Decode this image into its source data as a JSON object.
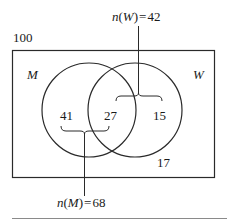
{
  "diagram": {
    "type": "venn",
    "universe": {
      "label": "100",
      "total": 100
    },
    "sets": [
      {
        "id": "M",
        "label": "M",
        "count_label": "n(M) = 68",
        "count": 68
      },
      {
        "id": "W",
        "label": "W",
        "count_label": "n(W) = 42",
        "count": 42
      }
    ],
    "regions": {
      "only_M": "41",
      "both": "27",
      "only_W": "15",
      "neither": "17"
    },
    "annotations": {
      "top": {
        "prefix": "n",
        "open": "(",
        "set": "W",
        "close": ")",
        "equals": "=",
        "value": "42"
      },
      "bottom": {
        "prefix": "n",
        "open": "(",
        "set": "M",
        "close": ")",
        "equals": "=",
        "value": "68"
      }
    },
    "colors": {
      "stroke": "#2a2a2a",
      "text": "#1a1a1a",
      "rule": "#8a8a8a"
    }
  }
}
